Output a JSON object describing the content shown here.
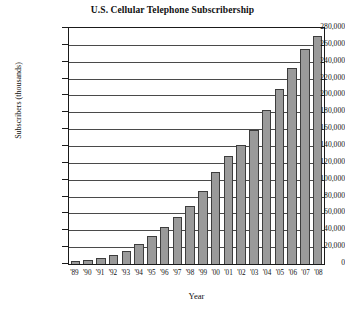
{
  "chart_data": {
    "type": "bar",
    "title": "U.S. Cellular Telephone Subscribership",
    "xlabel": "Year",
    "ylabel": "Subscribers (thousands)",
    "categories": [
      "'89",
      "'90",
      "'91",
      "'92",
      "'93",
      "'94",
      "'95",
      "'96",
      "'97",
      "'98",
      "'99",
      "'00",
      "'01",
      "'02",
      "'03",
      "'04",
      "'05",
      "'06",
      "'07",
      "'08"
    ],
    "values": [
      3509,
      5283,
      7557,
      11033,
      16009,
      24134,
      33786,
      44043,
      55312,
      69209,
      86047,
      109478,
      128375,
      140767,
      158722,
      182140,
      207896,
      233041,
      255396,
      270334
    ],
    "ylim": [
      0,
      280000
    ],
    "ytick_labels": [
      "280,000",
      "260,000",
      "240,000",
      "220,000",
      "200,000",
      "180,000",
      "160,000",
      "140,000",
      "120,000",
      "100,000",
      "80,000",
      "60,000",
      "40,000",
      "20,000",
      "0"
    ],
    "ytick_values": [
      280000,
      260000,
      240000,
      220000,
      200000,
      180000,
      160000,
      140000,
      120000,
      100000,
      80000,
      60000,
      40000,
      20000,
      0
    ],
    "grid": true,
    "legend": "none",
    "bar_color": "#9a9a9a",
    "bar_edge_color": "#3d3d3d",
    "axis_color": "#1a1a1a",
    "grid_color": "#4a4a4a"
  }
}
